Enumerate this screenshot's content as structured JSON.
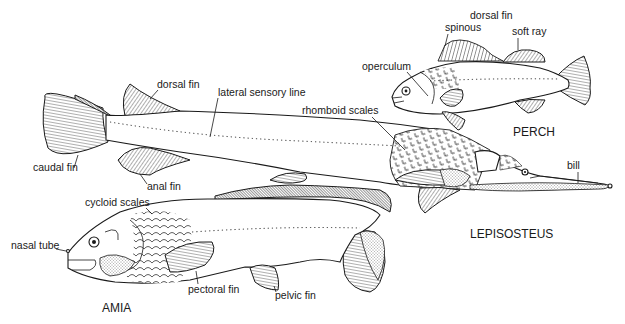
{
  "figure": {
    "type": "scientific illustration"
  },
  "specimens": {
    "perch": {
      "name": "PERCH",
      "labels": {
        "dorsal_fin": "dorsal fin",
        "spinous": "spinous",
        "soft_ray": "soft ray",
        "operculum": "operculum"
      }
    },
    "lepisosteus": {
      "name": "LEPISOSTEUS",
      "labels": {
        "dorsal_fin": "dorsal fin",
        "lateral_sensory_line": "lateral sensory line",
        "rhomboid_scales": "rhomboid scales",
        "caudal_fin": "caudal fin",
        "anal_fin": "anal fin",
        "bill": "bill"
      }
    },
    "amia": {
      "name": "AMIA",
      "labels": {
        "cycloid_scales": "cycloid scales",
        "nasal_tube": "nasal tube",
        "pectoral_fin": "pectoral fin",
        "pelvic_fin": "pelvic fin"
      }
    }
  },
  "colors": {
    "ink": "#1a1a1a",
    "paper": "#ffffff"
  }
}
